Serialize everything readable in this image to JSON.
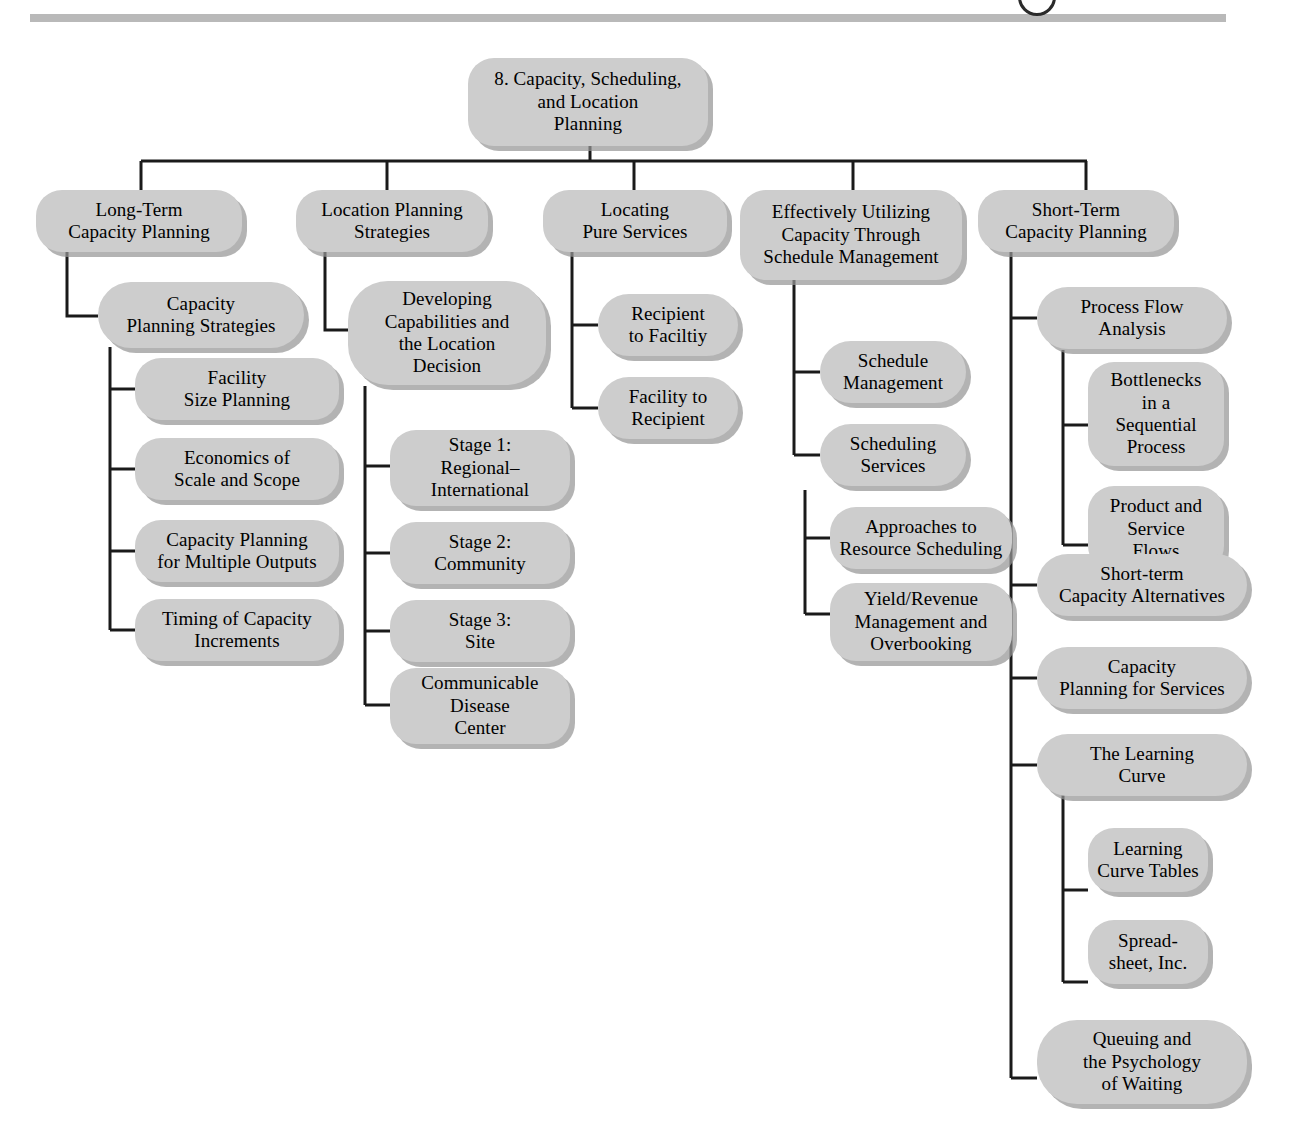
{
  "page": {
    "ornaments": {
      "top_rule": "horizontal-rule",
      "top_circle": "circle-outline"
    },
    "colors": {
      "node_fill": "#cdcdcd",
      "node_shadow": "#969696",
      "connector": "#1a1a1a",
      "rule": "#b9b9b9",
      "text": "#000000",
      "background": "#ffffff"
    }
  },
  "tree": {
    "root": {
      "id": "root",
      "label": "8. Capacity, Scheduling,\nand Location\nPlanning",
      "line1": "8. Capacity, Scheduling,",
      "line2": "and Location",
      "line3": "Planning"
    },
    "branches": [
      {
        "id": "long-term-capacity-planning",
        "label": "Long-Term\nCapacity Planning",
        "children": [
          {
            "id": "capacity-planning-strategies",
            "label": "Capacity\nPlanning Strategies",
            "children": [
              {
                "id": "facility-size-planning",
                "label": "Facility\nSize Planning"
              },
              {
                "id": "economics-of-scale-and-scope",
                "label": "Economics of\nScale and Scope"
              },
              {
                "id": "capacity-planning-for-multiple-outputs",
                "label": "Capacity Planning\nfor Multiple Outputs"
              },
              {
                "id": "timing-of-capacity-increments",
                "label": "Timing of Capacity\nIncrements"
              }
            ]
          }
        ]
      },
      {
        "id": "location-planning-strategies",
        "label": "Location Planning\nStrategies",
        "children": [
          {
            "id": "developing-capabilities-and-the-location-decision",
            "label": "Developing\nCapabilities and\nthe Location\nDecision",
            "children": [
              {
                "id": "stage-1-regional-international",
                "label": "Stage 1:\nRegional–\nInternational"
              },
              {
                "id": "stage-2-community",
                "label": "Stage 2:\nCommunity"
              },
              {
                "id": "stage-3-site",
                "label": "Stage 3:\nSite"
              },
              {
                "id": "communicable-disease-center",
                "label": "Communicable\nDisease\nCenter"
              }
            ]
          }
        ]
      },
      {
        "id": "locating-pure-services",
        "label": "Locating\nPure Services",
        "children": [
          {
            "id": "recipient-to-faciltiy",
            "label": "Recipient\nto Faciltiy"
          },
          {
            "id": "facility-to-recipient",
            "label": "Facility to\nRecipient"
          }
        ]
      },
      {
        "id": "effectively-utilizing-capacity-through-schedule-management",
        "label": "Effectively Utilizing\nCapacity Through\nSchedule Management",
        "children": [
          {
            "id": "schedule-management",
            "label": "Schedule\nManagement"
          },
          {
            "id": "scheduling-services",
            "label": "Scheduling\nServices",
            "children": [
              {
                "id": "approaches-to-resource-scheduling",
                "label": "Approaches to\nResource Scheduling"
              },
              {
                "id": "yield-revenue-management-and-overbooking",
                "label": "Yield/Revenue\nManagement and\nOverbooking"
              }
            ]
          }
        ]
      },
      {
        "id": "short-term-capacity-planning",
        "label": "Short-Term\nCapacity Planning",
        "children": [
          {
            "id": "process-flow-analysis",
            "label": "Process Flow\nAnalysis",
            "children": [
              {
                "id": "bottlenecks-in-a-sequential-process",
                "label": "Bottlenecks\nin a\nSequential\nProcess"
              },
              {
                "id": "product-and-service-flows",
                "label": "Product and\nService\nFlows"
              }
            ]
          },
          {
            "id": "short-term-capacity-alternatives",
            "label": "Short-term\nCapacity Alternatives"
          },
          {
            "id": "capacity-planning-for-services",
            "label": "Capacity\nPlanning for Services"
          },
          {
            "id": "the-learning-curve",
            "label": "The Learning\nCurve",
            "children": [
              {
                "id": "learning-curve-tables",
                "label": "Learning\nCurve Tables"
              },
              {
                "id": "spreadsheet-inc",
                "label": "Spread-\nsheet, Inc."
              }
            ]
          },
          {
            "id": "queuing-and-the-psychology-of-waiting",
            "label": "Queuing and\nthe Psychology\nof Waiting"
          }
        ]
      }
    ]
  },
  "nodes": {
    "root": "8. Capacity, Scheduling,\nand Location\nPlanning",
    "b1": "Long-Term\nCapacity Planning",
    "b1c1": "Capacity\nPlanning Strategies",
    "b1c1a": "Facility\nSize Planning",
    "b1c1b": "Economics of\nScale and Scope",
    "b1c1c": "Capacity Planning\nfor Multiple Outputs",
    "b1c1d": "Timing of Capacity\nIncrements",
    "b2": "Location Planning\nStrategies",
    "b2c1": "Developing\nCapabilities and\nthe Location\nDecision",
    "b2c1a": "Stage 1:\nRegional–\nInternational",
    "b2c1b": "Stage 2:\nCommunity",
    "b2c1c": "Stage 3:\nSite",
    "b2c1d": "Communicable\nDisease\nCenter",
    "b3": "Locating\nPure Services",
    "b3c1": "Recipient\nto Faciltiy",
    "b3c2": "Facility to\nRecipient",
    "b4": "Effectively Utilizing\nCapacity Through\nSchedule Management",
    "b4c1": "Schedule\nManagement",
    "b4c2": "Scheduling\nServices",
    "b4c2a": "Approaches to\nResource Scheduling",
    "b4c2b": "Yield/Revenue\nManagement and\nOverbooking",
    "b5": "Short-Term\nCapacity Planning",
    "b5c1": "Process Flow\nAnalysis",
    "b5c1a": "Bottlenecks\nin a\nSequential\nProcess",
    "b5c1b": "Product and\nService\nFlows",
    "b5c2": "Short-term\nCapacity Alternatives",
    "b5c3": "Capacity\nPlanning for Services",
    "b5c4": "The Learning\nCurve",
    "b5c4a": "Learning\nCurve Tables",
    "b5c4b": "Spread-\nsheet, Inc.",
    "b5c5": "Queuing and\nthe Psychology\nof Waiting"
  }
}
